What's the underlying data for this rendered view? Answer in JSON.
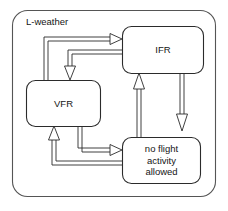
{
  "diagram": {
    "kind": "state-machine-diagram",
    "region": {
      "label": "L-weather",
      "shape": "rounded-rectangle",
      "stroke_color": "#555555",
      "fill_color": "#ffffff"
    },
    "states": [
      {
        "id": "ifr",
        "label": "IFR",
        "lines": [
          "IFR"
        ],
        "x": 122,
        "y": 26,
        "width": 81,
        "height": 47
      },
      {
        "id": "vfr",
        "label": "VFR",
        "lines": [
          "VFR"
        ],
        "x": 26,
        "y": 80,
        "width": 74,
        "height": 46
      },
      {
        "id": "no_flight",
        "label": "no flight activity allowed",
        "lines": [
          "no flight",
          "activity",
          "allowed"
        ],
        "x": 122,
        "y": 137,
        "width": 78,
        "height": 46
      }
    ],
    "transitions": [
      {
        "id": "vfr-to-ifr",
        "from": "vfr",
        "to": "ifr",
        "arrowhead": "open-triangle",
        "direction": "right"
      },
      {
        "id": "ifr-to-vfr",
        "from": "ifr",
        "to": "vfr",
        "arrowhead": "open-triangle",
        "direction": "down"
      },
      {
        "id": "ifr-to-no-flight",
        "from": "ifr",
        "to": "no_flight",
        "arrowhead": "open-triangle",
        "direction": "down"
      },
      {
        "id": "no-flight-to-ifr",
        "from": "no_flight",
        "to": "ifr",
        "arrowhead": "open-triangle",
        "direction": "up"
      },
      {
        "id": "vfr-to-no-flight",
        "from": "vfr",
        "to": "no_flight",
        "arrowhead": "open-triangle",
        "direction": "right"
      },
      {
        "id": "no-flight-to-vfr",
        "from": "no_flight",
        "to": "vfr",
        "arrowhead": "open-triangle",
        "direction": "up"
      }
    ],
    "colors": {
      "stroke": "#2b2b2b",
      "region_stroke": "#555555",
      "text": "#151515",
      "background": "#ffffff"
    }
  }
}
